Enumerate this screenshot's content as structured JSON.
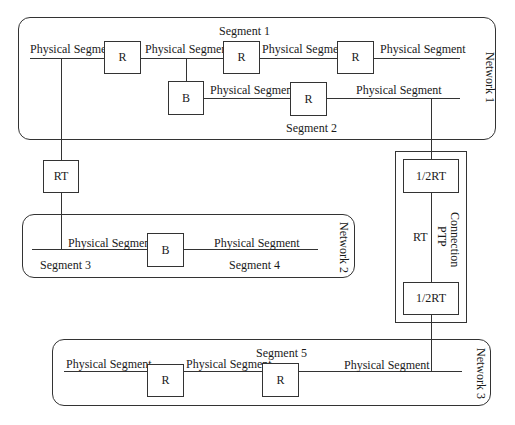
{
  "networks": {
    "n1": {
      "label": "Network 1"
    },
    "n2": {
      "label": "Network 2"
    },
    "n3": {
      "label": "Network 3"
    }
  },
  "segments": {
    "seg1": "Segment 1",
    "seg2": "Segment 2",
    "seg3": "Segment 3",
    "seg4": "Segment 4",
    "seg5": "Segment 5"
  },
  "physical_segment": "Physical Segment",
  "nodes": {
    "router": "R",
    "bridge": "B",
    "remote_router": "RT",
    "half_rt": "1/2RT"
  },
  "ptp": {
    "label_line1": "PTP",
    "label_line2": "Connection",
    "rt_label": "RT"
  }
}
